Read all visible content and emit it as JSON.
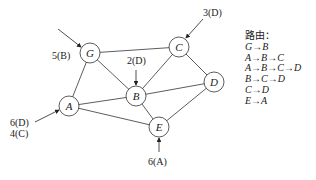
{
  "diagram": {
    "nodes": [
      {
        "id": "G",
        "label": "G",
        "x": 90,
        "y": 53
      },
      {
        "id": "C",
        "label": "C",
        "x": 179,
        "y": 47
      },
      {
        "id": "B",
        "label": "B",
        "x": 136,
        "y": 96
      },
      {
        "id": "D",
        "label": "D",
        "x": 214,
        "y": 82
      },
      {
        "id": "A",
        "label": "A",
        "x": 69,
        "y": 106
      },
      {
        "id": "E",
        "label": "E",
        "x": 159,
        "y": 127
      }
    ],
    "edges": [
      [
        "G",
        "C"
      ],
      [
        "G",
        "B"
      ],
      [
        "G",
        "A"
      ],
      [
        "C",
        "B"
      ],
      [
        "C",
        "D"
      ],
      [
        "B",
        "D"
      ],
      [
        "B",
        "A"
      ],
      [
        "B",
        "E"
      ],
      [
        "A",
        "E"
      ],
      [
        "E",
        "D"
      ]
    ],
    "inputs": [
      {
        "target": "G",
        "label": "5(B)"
      },
      {
        "target": "C",
        "label": "3(D)"
      },
      {
        "target": "B",
        "label": "2(D)"
      },
      {
        "target": "A",
        "label_line1": "6(D)",
        "label_line2": "4(C)"
      },
      {
        "target": "E",
        "label": "6(A)"
      }
    ]
  },
  "routes": {
    "title": "路由：",
    "items": [
      "G→B",
      "A→B→C",
      "A→B→C→D",
      "B→C→D",
      "C→D",
      "E→A"
    ]
  }
}
